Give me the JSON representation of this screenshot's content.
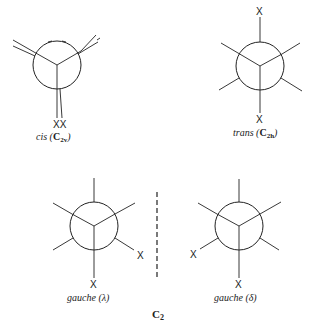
{
  "figure": {
    "substituent_label": "X",
    "conformers": [
      {
        "id": "cis",
        "name": "cis",
        "point_group": "C2v",
        "caption_name": "cis",
        "caption_group_main": "C",
        "caption_group_sub": "2v",
        "x_labels": [
          "X",
          "X"
        ],
        "x_text": "XX"
      },
      {
        "id": "trans",
        "name": "trans",
        "point_group": "C2h",
        "caption_name": "trans",
        "caption_group_main": "C",
        "caption_group_sub": "2h",
        "x_labels": [
          "X",
          "X"
        ]
      },
      {
        "id": "gauche-lambda",
        "name": "gauche",
        "chirality": "λ",
        "caption": "gauche (λ)",
        "x_labels": [
          "X",
          "X"
        ]
      },
      {
        "id": "gauche-delta",
        "name": "gauche",
        "chirality": "δ",
        "caption": "gauche (δ)",
        "x_labels": [
          "X",
          "X"
        ]
      }
    ],
    "gauche_pair_group": "C",
    "gauche_pair_group_sub": "2"
  }
}
